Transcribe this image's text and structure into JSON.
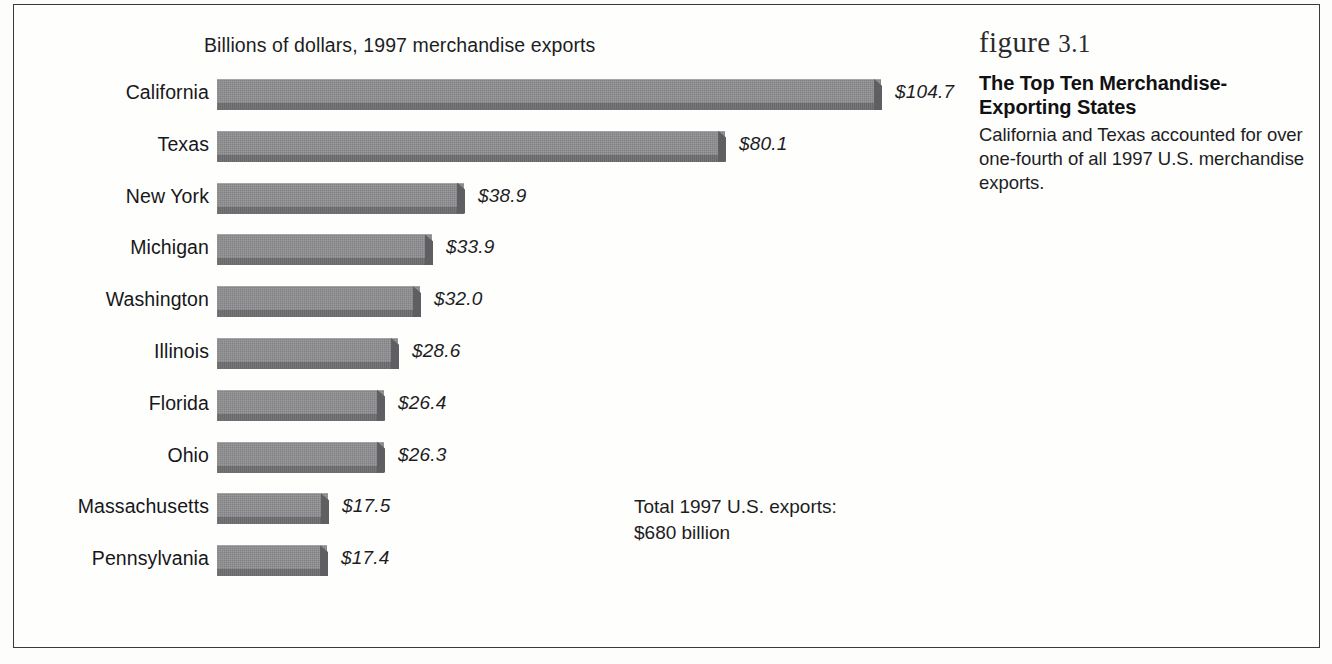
{
  "figure": {
    "number_label": "figure",
    "number": "3.1",
    "caption_title": "The Top Ten Merchandise-Exporting States",
    "caption_body": "California and Texas accounted for over one-fourth of all 1997 U.S. merchandise exports."
  },
  "annotation": {
    "total_note": "Total 1997 U.S. exports:\n$680 billion"
  },
  "colors": {
    "bar_face": "#8e8e90",
    "bar_lip": "#6e6e71",
    "bar_cap": "#5f5f63",
    "text": "#1d1d1f",
    "frame": "#3a3a3c",
    "background": "#fefefd"
  },
  "chart_data": {
    "type": "bar",
    "orientation": "horizontal",
    "title": "Billions of dollars, 1997 merchandise exports",
    "xlabel": "",
    "ylabel": "",
    "xlim": [
      0,
      110
    ],
    "grid": false,
    "legend": null,
    "value_prefix": "$",
    "categories": [
      "California",
      "Texas",
      "New York",
      "Michigan",
      "Washington",
      "Illinois",
      "Florida",
      "Ohio",
      "Massachusetts",
      "Pennsylvania"
    ],
    "values": [
      104.7,
      80.1,
      38.9,
      33.9,
      32.0,
      28.6,
      26.4,
      26.3,
      17.5,
      17.4
    ],
    "value_labels": [
      "$104.7",
      "$80.1",
      "$38.9",
      "$33.9",
      "$32.0",
      "$28.6",
      "$26.4",
      "$26.3",
      "$17.5",
      "$17.4"
    ],
    "annotations": [
      "Total 1997 U.S. exports: $680 billion"
    ]
  }
}
